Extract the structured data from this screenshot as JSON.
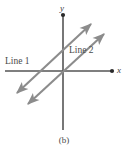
{
  "figure": {
    "caption": "(b)",
    "background_color": "#ffffff"
  },
  "axes": {
    "x_label": "x",
    "y_label": "y",
    "axis_color": "#555555",
    "x_axis": {
      "x1": 5,
      "y1": 71,
      "x2": 111,
      "y2": 71,
      "end_marker": "dot"
    },
    "y_axis": {
      "x1": 63,
      "y1": 16,
      "x2": 63,
      "y2": 130,
      "end_marker": "dot"
    }
  },
  "lines": [
    {
      "label": "Line 1",
      "color": "#8c8c8c",
      "style": "double-headed-arrow",
      "start": {
        "x": 17,
        "y": 93
      },
      "end": {
        "x": 91,
        "y": 24
      },
      "slope_sign": "positive"
    },
    {
      "label": "Line 2",
      "color": "#8c8c8c",
      "style": "double-headed-arrow",
      "start": {
        "x": 28,
        "y": 104
      },
      "end": {
        "x": 104,
        "y": 34
      },
      "slope_sign": "positive"
    }
  ],
  "relationship": "parallel"
}
